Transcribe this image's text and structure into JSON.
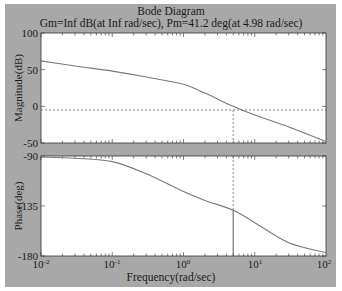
{
  "chart_data": [
    {
      "type": "line",
      "panel": "magnitude",
      "title": "Bode Diagram",
      "subtitle": "Gm=Inf dB(at Inf rad/sec), Pm=41.2 deg(at 4.98 rad/sec)",
      "xlabel": "Frequency(rad/sec)",
      "ylabel": "Magnitude(dB)",
      "xscale": "log",
      "xlim": [
        0.01,
        100
      ],
      "ylim": [
        -50,
        100
      ],
      "yticks": [
        -50,
        0,
        50,
        100
      ],
      "x": [
        0.01,
        0.03,
        0.1,
        0.3,
        1,
        2,
        4.98,
        10,
        30,
        100
      ],
      "series": [
        {
          "name": "magnitude",
          "values": [
            62,
            55,
            48,
            40,
            30,
            18,
            0,
            -12,
            -28,
            -48
          ]
        }
      ],
      "reference_lines": {
        "horizontal_dashed_y": 0,
        "vertical_dashed_x": 4.98
      },
      "grid": false
    },
    {
      "type": "line",
      "panel": "phase",
      "xlabel": "Frequency(rad/sec)",
      "ylabel": "Phase(deg)",
      "xscale": "log",
      "xlim": [
        0.01,
        100
      ],
      "ylim": [
        -180,
        -90
      ],
      "yticks": [
        -180,
        -135,
        -90
      ],
      "xticks": [
        "10^-2",
        "10^-1",
        "10^0",
        "10^1",
        "10^2"
      ],
      "x": [
        0.01,
        0.03,
        0.1,
        0.3,
        1,
        2,
        4.98,
        10,
        30,
        100
      ],
      "series": [
        {
          "name": "phase",
          "values": [
            -91,
            -92,
            -95,
            -106,
            -122,
            -130,
            -138.8,
            -150,
            -168,
            -177
          ]
        }
      ],
      "reference_lines": {
        "vertical_solid_x": 4.98,
        "phase_at_crossover": -138.8
      },
      "grid": false
    }
  ],
  "labels": {
    "title": "Bode Diagram",
    "subtitle": "Gm=Inf dB(at Inf rad/sec), Pm=41.2 deg(at 4.98 rad/sec)",
    "xlabel": "Frequency(rad/sec)",
    "mag_ylabel": "Magnitude(dB)",
    "phase_ylabel": "Phase(deg)",
    "mag_yticks": [
      "100",
      "50",
      "0",
      "-50"
    ],
    "phase_yticks": [
      "-90",
      "-135",
      "-180"
    ],
    "xtick_base": "10",
    "xtick_exps": [
      "-2",
      "-1",
      "0",
      "1",
      "2"
    ]
  },
  "colors": {
    "background": "#a8a8a8",
    "axes": "#ffffff",
    "curve": "#7a7a7a",
    "marker": "#444444"
  }
}
